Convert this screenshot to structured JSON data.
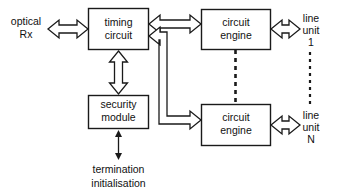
{
  "diagram": {
    "background_color": "#ffffff",
    "line_color": "#1a1a1a",
    "text_color": "#111111",
    "blocks": [
      {
        "id": "timing-circuit",
        "line1": "timing",
        "line2": "circuit"
      },
      {
        "id": "security-module",
        "line1": "security",
        "line2": "module"
      },
      {
        "id": "circuit-engine-1",
        "line1": "circuit",
        "line2": "engine"
      },
      {
        "id": "circuit-engine-n",
        "line1": "circuit",
        "line2": "engine"
      }
    ],
    "labels": {
      "optical_rx_line1": "optical",
      "optical_rx_line2": "Rx",
      "line_unit_1_line1": "line",
      "line_unit_1_line2": "unit",
      "line_unit_1_line3": "1",
      "line_unit_n_line1": "line",
      "line_unit_n_line2": "unit",
      "line_unit_n_line3": "N",
      "termination": "termination",
      "initialisation": "initialisation"
    },
    "connectors": [
      {
        "id": "optical-rx-to-timing",
        "style": "hollow-double-arrow",
        "orientation": "horizontal"
      },
      {
        "id": "timing-to-engine-1",
        "style": "hollow-double-arrow",
        "orientation": "horizontal"
      },
      {
        "id": "timing-to-security",
        "style": "hollow-double-arrow",
        "orientation": "vertical"
      },
      {
        "id": "timing-to-engine-n-branch",
        "style": "hollow-single-arrow",
        "orientation": "elbow"
      },
      {
        "id": "engine-1-to-line-unit-1",
        "style": "hollow-double-arrow",
        "orientation": "horizontal"
      },
      {
        "id": "engine-n-to-line-unit-n",
        "style": "hollow-double-arrow",
        "orientation": "horizontal"
      },
      {
        "id": "security-to-termination",
        "style": "thin-double-arrow",
        "orientation": "vertical"
      },
      {
        "id": "engine-1-to-engine-n",
        "style": "dashed",
        "orientation": "vertical"
      },
      {
        "id": "line-unit-1-to-line-unit-n",
        "style": "dashed",
        "orientation": "vertical"
      }
    ]
  }
}
